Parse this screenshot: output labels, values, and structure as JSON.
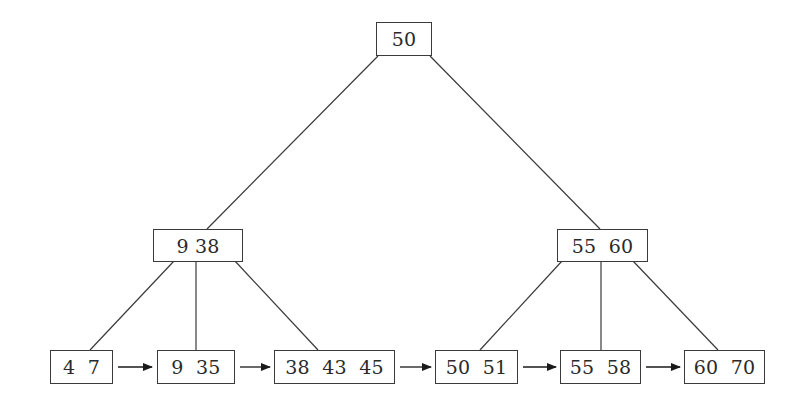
{
  "diagram": {
    "type": "B+ tree",
    "root": {
      "id": "root",
      "keys": [
        "50"
      ],
      "label": "50"
    },
    "internal": [
      {
        "id": "int-left",
        "keys": [
          "9",
          "38"
        ],
        "label": "9 38"
      },
      {
        "id": "int-right",
        "keys": [
          "55",
          "60"
        ],
        "label": "55  60"
      }
    ],
    "leaves": [
      {
        "id": "leaf-1",
        "keys": [
          "4",
          "7"
        ],
        "label": "4  7"
      },
      {
        "id": "leaf-2",
        "keys": [
          "9",
          "35"
        ],
        "label": "9  35"
      },
      {
        "id": "leaf-3",
        "keys": [
          "38",
          "43",
          "45"
        ],
        "label": "38  43  45"
      },
      {
        "id": "leaf-4",
        "keys": [
          "50",
          "51"
        ],
        "label": "50  51"
      },
      {
        "id": "leaf-5",
        "keys": [
          "55",
          "58"
        ],
        "label": "55  58"
      },
      {
        "id": "leaf-6",
        "keys": [
          "60",
          "70"
        ],
        "label": "60  70"
      }
    ],
    "edges": [
      {
        "from": "root",
        "to": "int-left"
      },
      {
        "from": "root",
        "to": "int-right"
      },
      {
        "from": "int-left",
        "to": "leaf-1"
      },
      {
        "from": "int-left",
        "to": "leaf-2"
      },
      {
        "from": "int-left",
        "to": "leaf-3"
      },
      {
        "from": "int-right",
        "to": "leaf-4"
      },
      {
        "from": "int-right",
        "to": "leaf-5"
      },
      {
        "from": "int-right",
        "to": "leaf-6"
      }
    ],
    "leaf_links": [
      {
        "from": "leaf-1",
        "to": "leaf-2"
      },
      {
        "from": "leaf-2",
        "to": "leaf-3"
      },
      {
        "from": "leaf-3",
        "to": "leaf-4"
      },
      {
        "from": "leaf-4",
        "to": "leaf-5"
      },
      {
        "from": "leaf-5",
        "to": "leaf-6"
      }
    ],
    "colors": {
      "stroke": "#3a3a3a",
      "text": "#2a2a2a",
      "background": "#ffffff"
    }
  }
}
